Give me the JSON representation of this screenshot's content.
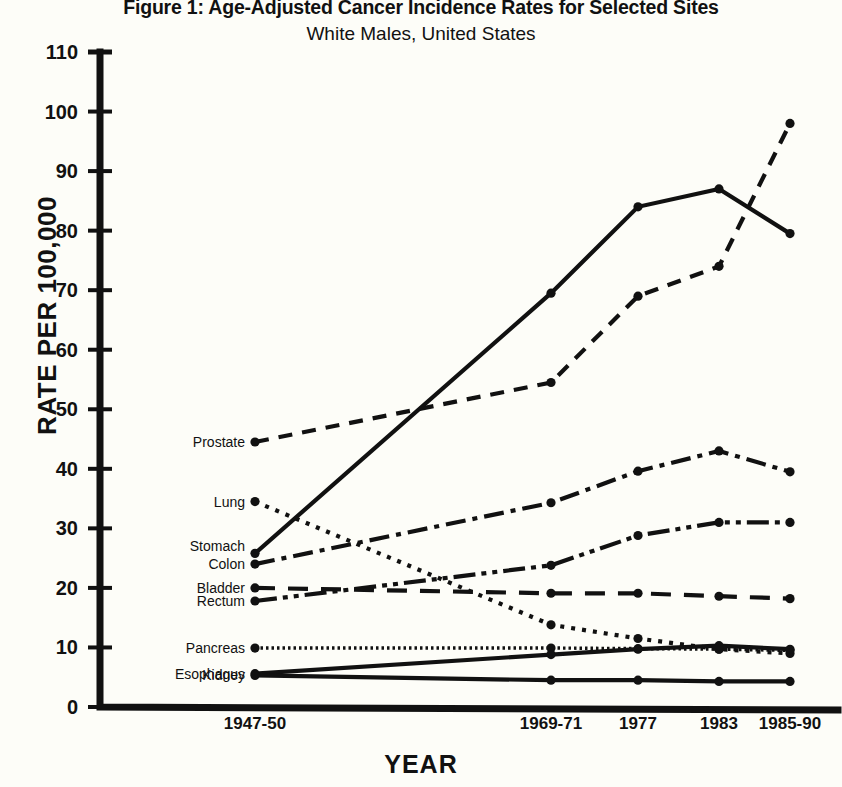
{
  "title": {
    "main": "Figure 1: Age-Adjusted Cancer Incidence Rates for Selected Sites",
    "sub": "White Males, United States"
  },
  "axes": {
    "ylabel": "RATE PER 100,000",
    "xlabel": "YEAR",
    "yticks": [
      "0",
      "10",
      "20",
      "30",
      "40",
      "50",
      "60",
      "70",
      "80",
      "90",
      "100",
      "110"
    ],
    "xticks": [
      "1947-50",
      "1969-71",
      "1977",
      "1983",
      "1985-90"
    ]
  },
  "chart_data": {
    "type": "line",
    "title": "Figure 1: Age-Adjusted Cancer Incidence Rates for Selected Sites",
    "subtitle": "White Males, United States",
    "xlabel": "YEAR",
    "ylabel": "RATE PER 100,000",
    "categories": [
      "1947-50",
      "1969-71",
      "1977",
      "1983",
      "1985-90"
    ],
    "ylim": [
      0,
      110
    ],
    "ytick_step": 10,
    "grid": false,
    "legend": "inline-left-labels",
    "series": [
      {
        "name": "Prostate",
        "values": [
          44.5,
          54.5,
          69.0,
          74.0,
          98.0
        ],
        "dash": "dashed"
      },
      {
        "name": "Lung",
        "values": [
          25.8,
          69.5,
          84.0,
          87.0,
          79.5
        ],
        "dash": "solid"
      },
      {
        "name": "Stomach",
        "values": [
          34.5,
          13.8,
          11.5,
          9.7,
          9.0
        ],
        "dash": "dotted"
      },
      {
        "name": "Colon",
        "values": [
          24.0,
          34.3,
          39.6,
          43.0,
          39.5
        ],
        "dash": "dashdot"
      },
      {
        "name": "Bladder",
        "values": [
          17.8,
          23.8,
          28.8,
          31.0,
          31.0
        ],
        "dash": "dashdotdot"
      },
      {
        "name": "Rectum",
        "values": [
          20.0,
          19.1,
          19.1,
          18.6,
          18.2
        ],
        "dash": "longdash"
      },
      {
        "name": "Pancreas",
        "values": [
          9.9,
          9.9,
          9.8,
          9.7,
          9.5
        ],
        "dash": "fine-dotted"
      },
      {
        "name": "Esophagus",
        "values": [
          5.6,
          8.8,
          9.7,
          10.3,
          9.7
        ],
        "dash": "solid"
      },
      {
        "name": "Kidney",
        "values": [
          5.3,
          4.5,
          4.5,
          4.3,
          4.3
        ],
        "dash": "solid"
      }
    ],
    "series_label_y": [
      44.5,
      34.5,
      27.0,
      24.0,
      20.0,
      17.8,
      9.9,
      5.6,
      5.3
    ]
  }
}
